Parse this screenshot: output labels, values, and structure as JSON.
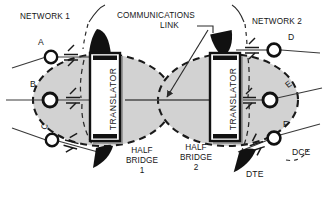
{
  "diagram": {
    "title_labels": {
      "network1": "NETWORK 1",
      "network2": "NETWORK 2",
      "comm_link_line1": "COMMUNICATIONS",
      "comm_link_line2": "LINK"
    },
    "translator_left": "TRANSLATOR",
    "translator_right": "TRANSLATOR",
    "bridges": [
      {
        "name": "half-bridge-1",
        "line1": "HALF",
        "line2": "BRIDGE",
        "line3": "1"
      },
      {
        "name": "half-bridge-2",
        "line1": "HALF",
        "line2": "BRIDGE",
        "line3": "2"
      }
    ],
    "nodes": [
      {
        "id": "A",
        "label": "A",
        "side": "left"
      },
      {
        "id": "B",
        "label": "B",
        "side": "left"
      },
      {
        "id": "C",
        "label": "C",
        "side": "left"
      },
      {
        "id": "D",
        "label": "D",
        "side": "right"
      },
      {
        "id": "E",
        "label": "E",
        "side": "right"
      },
      {
        "id": "F",
        "label": "F",
        "side": "right"
      }
    ],
    "device_labels": {
      "dte": "DTE",
      "dce": "DCE"
    },
    "colors": {
      "ink": "#151515",
      "bridge_fill": "#d2d2d2",
      "bridge_outline": "#1a1a1a",
      "translator_fill": "#ffffff",
      "line": "#3a3a3a"
    },
    "icon_names": [
      "dte-arrow-icon",
      "dce-circle-icon",
      "line-break-icon",
      "leader-arrow-icon"
    ]
  }
}
